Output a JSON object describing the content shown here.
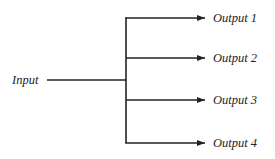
{
  "diagram": {
    "input": {
      "label": "Input"
    },
    "outputs": [
      {
        "label": "Output 1"
      },
      {
        "label": "Output 2"
      },
      {
        "label": "Output 3"
      },
      {
        "label": "Output 4"
      }
    ],
    "line_color": "#222222"
  }
}
